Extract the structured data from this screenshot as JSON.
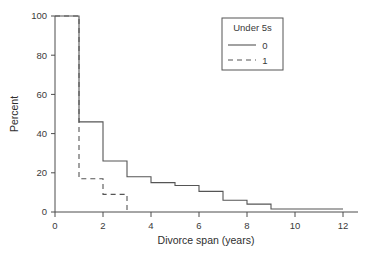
{
  "chart_data": {
    "type": "line",
    "title": "",
    "subtitle": "",
    "xlabel": "Divorce span (years)",
    "ylabel": "Percent",
    "xlim": [
      0,
      12.6
    ],
    "ylim": [
      0,
      100
    ],
    "xticks": [
      "0",
      "2",
      "4",
      "6",
      "8",
      "10",
      "12"
    ],
    "xtick_values": [
      0,
      2,
      4,
      6,
      8,
      10,
      12
    ],
    "yticks": [
      "0",
      "20",
      "40",
      "60",
      "80",
      "100"
    ],
    "ytick_values": [
      0,
      20,
      40,
      60,
      80,
      100
    ],
    "grid": false,
    "drawstyle": "steps-post",
    "legend": {
      "position": "top-right",
      "title": "Under 5s",
      "entries": [
        {
          "label": "0",
          "style": "solid"
        },
        {
          "label": "1",
          "style": "dashed"
        }
      ]
    },
    "series": [
      {
        "name": "0",
        "legend_label": "0",
        "style": "solid",
        "color": "#555555",
        "x": [
          0,
          1,
          2,
          3,
          4,
          5,
          6,
          7,
          8,
          9,
          12
        ],
        "values": [
          100,
          46,
          26,
          18,
          15,
          13.5,
          10.5,
          6,
          4,
          1.5,
          1.5
        ]
      },
      {
        "name": "1",
        "legend_label": "1",
        "style": "dashed",
        "color": "#555555",
        "x": [
          0,
          1,
          2,
          3
        ],
        "values": [
          100,
          17,
          9,
          0
        ]
      }
    ]
  },
  "colors": {
    "axis": "#4d4d4d",
    "series": "#555555",
    "background": "#ffffff",
    "text": "#3a3a3a"
  }
}
